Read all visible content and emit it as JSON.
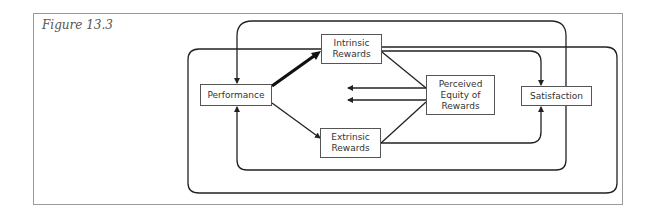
{
  "figure": {
    "title": "Figure 13.3"
  },
  "nodes": {
    "performance": "Performance",
    "intrinsic": "Intrinsic\nRewards",
    "extrinsic": "Extrinsic\nRewards",
    "equity": "Perceived\nEquity of\nRewards",
    "satisfaction": "Satisfaction"
  },
  "edges": [
    {
      "from": "Performance",
      "to": "Intrinsic Rewards",
      "style": "heavy"
    },
    {
      "from": "Performance",
      "to": "Extrinsic Rewards"
    },
    {
      "from": "Intrinsic Rewards",
      "to": "Perceived Equity of Rewards"
    },
    {
      "from": "Extrinsic Rewards",
      "to": "Perceived Equity of Rewards"
    },
    {
      "from": "Perceived Equity of Rewards",
      "to": "(left, two arrows)"
    },
    {
      "from": "Intrinsic Rewards",
      "to": "Satisfaction"
    },
    {
      "from": "Extrinsic Rewards",
      "to": "Satisfaction"
    },
    {
      "from": "Satisfaction",
      "to": "Performance",
      "route": "top loop"
    },
    {
      "from": "Satisfaction",
      "to": "Performance",
      "route": "inner bottom loop"
    },
    {
      "from": "Intrinsic Rewards",
      "to": "outer loop",
      "route": "outer loop around diagram"
    }
  ],
  "colors": {
    "line": "#222222",
    "frame": "#9a9a9a"
  }
}
